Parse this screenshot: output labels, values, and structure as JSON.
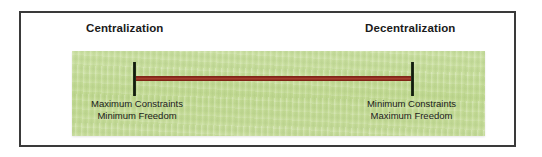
{
  "figure": {
    "type": "continuum-diagram",
    "poles": [
      {
        "heading": "Centralization",
        "caption_line_1": "Maximum Constraints",
        "caption_line_2": "Minimum Freedom",
        "position": "left"
      },
      {
        "heading": "Decentralization",
        "caption_line_1": "Minimum Constraints",
        "caption_line_2": "Maximum Freedom",
        "position": "right"
      }
    ],
    "axis": {
      "label": "centralization-decentralization-continuum",
      "left_marker": "tick-mark",
      "right_marker": "tick-mark"
    },
    "colors": {
      "panel_background": "#c6dc99",
      "spectrum_line": "#8c2b1e",
      "tick_mark": "#101a0c",
      "frame_border": "#3a3a3a",
      "heading_text": "#1a1a1a",
      "caption_text": "#1b1b1b",
      "page_background": "#ffffff"
    }
  }
}
